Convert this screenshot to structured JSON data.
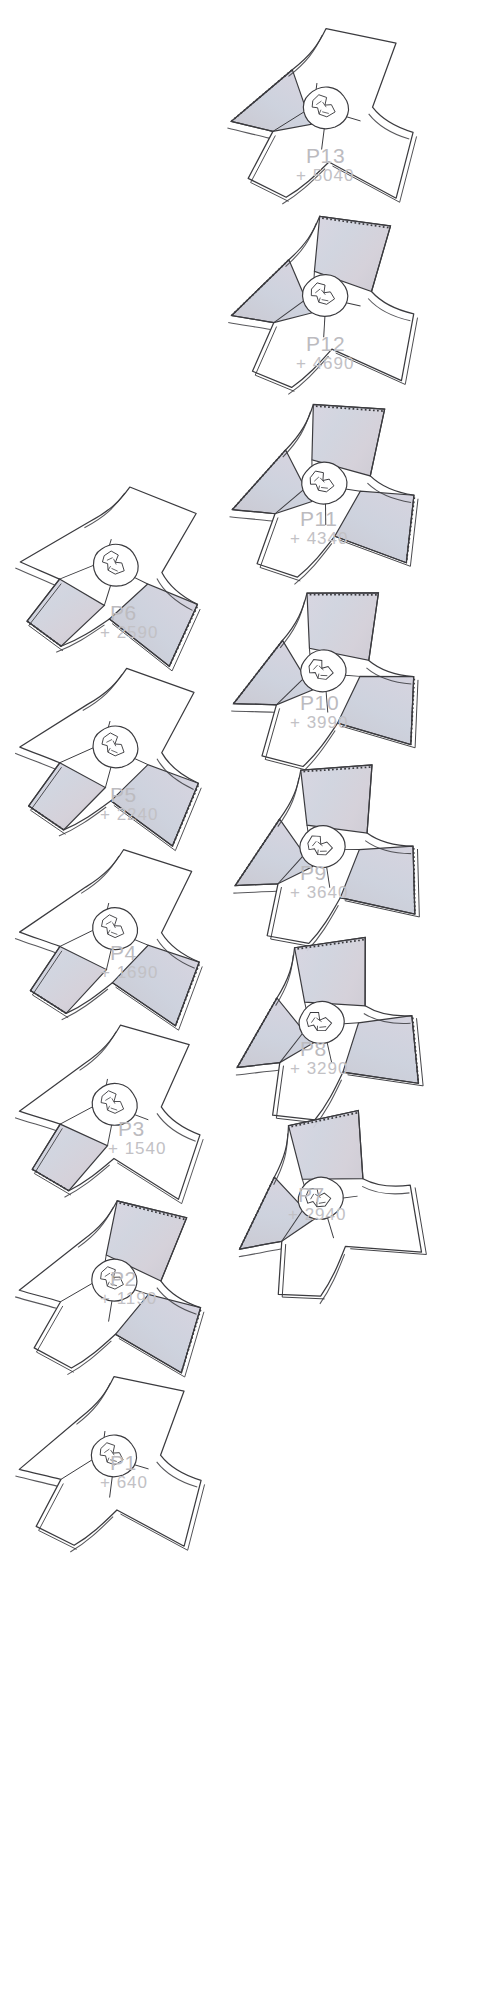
{
  "sheet": {
    "width": 481,
    "height": 1999,
    "background": "#ffffff",
    "ink": "#3b3b3f",
    "label_color": "#bcbbbf",
    "glass_tint": "#cfcdd6",
    "shade_fill": "#c9c7cf"
  },
  "plates": [
    {
      "id": "p13",
      "level": "P13",
      "elevation": "+ 5040",
      "rotation": -4,
      "wings_shaded": [
        "west"
      ],
      "x": 212,
      "y": 12,
      "label_x": 306,
      "label_y": 145
    },
    {
      "id": "p12",
      "level": "P12",
      "elevation": "+ 4690",
      "rotation": -8,
      "wings_shaded": [
        "west",
        "north"
      ],
      "x": 212,
      "y": 200,
      "label_x": 306,
      "label_y": 333
    },
    {
      "id": "p11",
      "level": "P11",
      "elevation": "+ 4340",
      "rotation": -12,
      "wings_shaded": [
        "west",
        "north",
        "east"
      ],
      "x": 212,
      "y": 388,
      "label_x": 300,
      "label_y": 508
    },
    {
      "id": "p10",
      "level": "P10",
      "elevation": "+ 3990",
      "rotation": -16,
      "wings_shaded": [
        "west",
        "north",
        "east"
      ],
      "x": 212,
      "y": 576,
      "label_x": 300,
      "label_y": 692
    },
    {
      "id": "p9",
      "level": "P9",
      "elevation": "+ 3640",
      "rotation": -20,
      "wings_shaded": [
        "west",
        "north",
        "east"
      ],
      "x": 212,
      "y": 752,
      "label_x": 300,
      "label_y": 862
    },
    {
      "id": "p8",
      "level": "P8",
      "elevation": "+ 3290",
      "rotation": -24,
      "wings_shaded": [
        "west",
        "north",
        "east"
      ],
      "x": 212,
      "y": 928,
      "label_x": 300,
      "label_y": 1038
    },
    {
      "id": "p7",
      "level": "P7",
      "elevation": "+ 2940",
      "rotation": -28,
      "wings_shaded": [
        "west",
        "north"
      ],
      "x": 212,
      "y": 1104,
      "label_x": 298,
      "label_y": 1184
    },
    {
      "id": "p6",
      "level": "P6",
      "elevation": "+ 2590",
      "rotation": 6,
      "wings_shaded": [
        "south",
        "east"
      ],
      "x": 0,
      "y": 468,
      "label_x": 110,
      "label_y": 602
    },
    {
      "id": "p5",
      "level": "P5",
      "elevation": "+ 2240",
      "rotation": 4,
      "wings_shaded": [
        "south",
        "east"
      ],
      "x": 0,
      "y": 650,
      "label_x": 110,
      "label_y": 784
    },
    {
      "id": "p4",
      "level": "P4",
      "elevation": "+ 1690",
      "rotation": 2,
      "wings_shaded": [
        "south",
        "east"
      ],
      "x": 0,
      "y": 832,
      "label_x": 110,
      "label_y": 942
    },
    {
      "id": "p3",
      "level": "P3",
      "elevation": "+ 1540",
      "rotation": 0,
      "wings_shaded": [
        "south"
      ],
      "x": 0,
      "y": 1008,
      "label_x": 118,
      "label_y": 1118
    },
    {
      "id": "p2",
      "level": "P2",
      "elevation": "+ 1190",
      "rotation": -2,
      "wings_shaded": [
        "north",
        "east"
      ],
      "x": 0,
      "y": 1184,
      "label_x": 110,
      "label_y": 1268
    },
    {
      "id": "p1",
      "level": "P1",
      "elevation": "+ 640",
      "rotation": -4,
      "wings_shaded": [],
      "x": 0,
      "y": 1360,
      "label_x": 110,
      "label_y": 1452
    }
  ]
}
